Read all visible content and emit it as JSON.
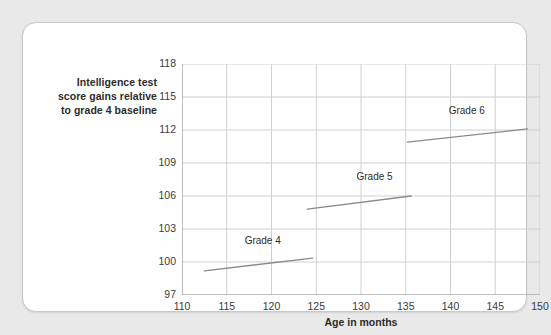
{
  "figure": {
    "y_caption_lines": [
      "Intelligence test",
      "score gains relative",
      "to grade 4 baseline"
    ],
    "y_caption_full": "Intelligence test score gains relative to grade 4 baseline"
  },
  "chart_data": {
    "type": "line",
    "title": "",
    "subtitle": "",
    "xlabel": "Age in months",
    "ylabel": "Intelligence test score gains relative to grade 4 baseline",
    "xlim": [
      110,
      150
    ],
    "ylim": [
      97,
      118
    ],
    "xticks": [
      110,
      115,
      120,
      125,
      130,
      135,
      140,
      145,
      150
    ],
    "xtick_labels": [
      "110",
      "115",
      "120",
      "125",
      "130",
      "135",
      "140",
      "145",
      "150"
    ],
    "yticks": [
      97,
      100,
      103,
      106,
      109,
      112,
      115,
      118
    ],
    "ytick_labels": [
      "97",
      "100",
      "103",
      "106",
      "109",
      "112",
      "115",
      "118"
    ],
    "grid": true,
    "grid_color": "#cfcfcf",
    "legend": "inline-annotations",
    "legend_position": "none",
    "line_color": "#8a8a8a",
    "series": [
      {
        "name": "Grade 4",
        "label": "Grade 4",
        "x": [
          112.5,
          124.6
        ],
        "y": [
          99.2,
          100.35
        ],
        "label_x": 117.0,
        "label_y": 101.8
      },
      {
        "name": "Grade 5",
        "label": "Grade 5",
        "x": [
          124.0,
          135.6
        ],
        "y": [
          104.8,
          106.0
        ],
        "label_x": 129.5,
        "label_y": 107.6
      },
      {
        "name": "Grade 6",
        "label": "Grade 6",
        "x": [
          135.2,
          148.6
        ],
        "y": [
          110.9,
          112.1
        ],
        "label_x": 139.8,
        "label_y": 113.6
      }
    ],
    "annotations": [
      {
        "text": "Grade 4",
        "x": 117.0,
        "y": 101.8
      },
      {
        "text": "Grade 5",
        "x": 129.5,
        "y": 107.6
      },
      {
        "text": "Grade 6",
        "x": 139.8,
        "y": 113.6
      }
    ]
  }
}
